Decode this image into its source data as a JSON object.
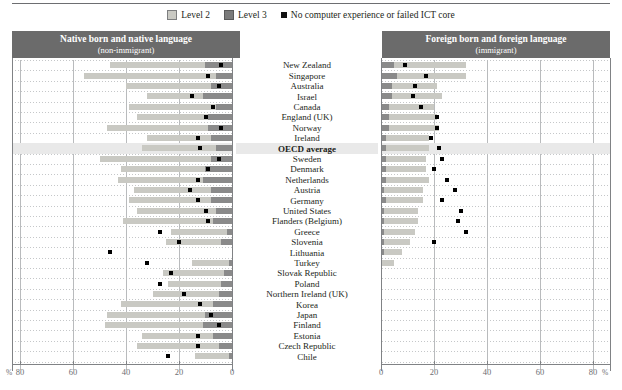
{
  "top_partial_text": "",
  "legend": {
    "items": [
      {
        "id": "level-2",
        "label": "Level 2",
        "swatch": "level2-swatch",
        "color": "#c9c9c3"
      },
      {
        "id": "level-3",
        "label": "Level 3",
        "swatch": "level3-swatch",
        "color": "#7b7b7b"
      },
      {
        "id": "no-computer",
        "label": "No computer experience or failed ICT core",
        "swatch": "no-computer-marker",
        "color": "#111111"
      }
    ]
  },
  "panels": {
    "left": {
      "title": "Native born and native language",
      "subtitle": "(non-immigrant)"
    },
    "right": {
      "title": "Foreign born and foreign language",
      "subtitle": "(immigrant)"
    }
  },
  "axis": {
    "left_ticks": [
      "80",
      "60",
      "40",
      "20",
      "0"
    ],
    "right_ticks": [
      "0",
      "20",
      "40",
      "60",
      "80"
    ],
    "unit_left": "%",
    "unit_right": "%",
    "max": 80
  },
  "chart_data": {
    "type": "bar",
    "xlabel": "%",
    "ylabel": "",
    "xlim": [
      0,
      80
    ],
    "grid": true,
    "legend_position": "top-center",
    "orientation": "horizontal-diverging",
    "panels": [
      "Native born and native language (non-immigrant)",
      "Foreign born and foreign language (immigrant)"
    ],
    "series": [
      {
        "name": "Level 2",
        "color": "#c9c9c3"
      },
      {
        "name": "Level 3",
        "color": "#8a8a8a"
      },
      {
        "name": "No computer experience or failed ICT core",
        "color": "#111111",
        "marker": "square"
      }
    ],
    "categories": [
      "New Zealand",
      "Singapore",
      "Australia",
      "Israel",
      "Canada",
      "England (UK)",
      "Norway",
      "Ireland",
      "OECD average",
      "Sweden",
      "Denmark",
      "Netherlands",
      "Austria",
      "Germany",
      "United States",
      "Flanders (Belgium)",
      "Greece",
      "Slovenia",
      "Lithuania",
      "Turkey",
      "Slovak Republic",
      "Poland",
      "Northern Ireland (UK)",
      "Korea",
      "Japan",
      "Finland",
      "Estonia",
      "Czech Republic",
      "Chile"
    ],
    "highlight_category": "OECD average",
    "native": {
      "level2": [
        36,
        50,
        32,
        21,
        33,
        27,
        38,
        24,
        28,
        42,
        32,
        32,
        29,
        31,
        30,
        34,
        21,
        21,
        0,
        14,
        23,
        20,
        25,
        35,
        37,
        37,
        27,
        31,
        13
      ],
      "level3": [
        10,
        6,
        8,
        11,
        6,
        9,
        9,
        8,
        6,
        8,
        10,
        11,
        8,
        8,
        6,
        7,
        2,
        4,
        0,
        1,
        3,
        4,
        5,
        7,
        10,
        11,
        7,
        5,
        1
      ],
      "no_computer": [
        4,
        9,
        5,
        15,
        7,
        10,
        4,
        13,
        12,
        5,
        9,
        13,
        16,
        13,
        10,
        9,
        27,
        20,
        46,
        32,
        23,
        27,
        18,
        12,
        8,
        5,
        13,
        13,
        24
      ]
    },
    "immigrant": {
      "level2": [
        27,
        26,
        17,
        19,
        17,
        18,
        19,
        16,
        16,
        15,
        15,
        16,
        15,
        14,
        13,
        13,
        12,
        10,
        7,
        5,
        0,
        0,
        0,
        0,
        0,
        0,
        0,
        0,
        0
      ],
      "level3": [
        5,
        6,
        4,
        4,
        3,
        3,
        3,
        2,
        2,
        2,
        2,
        2,
        1,
        2,
        1,
        1,
        1,
        1,
        1,
        0,
        0,
        0,
        0,
        0,
        0,
        0,
        0,
        0,
        0
      ],
      "no_computer": [
        9,
        17,
        13,
        12,
        15,
        21,
        21,
        19,
        22,
        23,
        20,
        25,
        28,
        23,
        30,
        29,
        32,
        20,
        null,
        null,
        null,
        null,
        null,
        null,
        null,
        null,
        null,
        null,
        null
      ]
    }
  }
}
